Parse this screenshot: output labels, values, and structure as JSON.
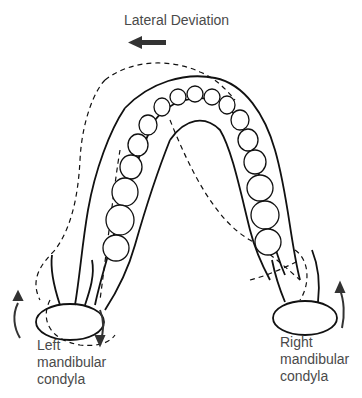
{
  "title": "Lateral Deviation",
  "direction_arrow": {
    "direction": "left",
    "color": "#333333"
  },
  "labels": {
    "left": [
      "Left",
      "mandibular",
      "condyla"
    ],
    "right": [
      "Right",
      "mandibular",
      "condyla"
    ]
  },
  "caption": "Fig. Mandibular lateral deviation (cut-off caption)",
  "colors": {
    "line": "#111111",
    "text": "#4a4a4a"
  }
}
